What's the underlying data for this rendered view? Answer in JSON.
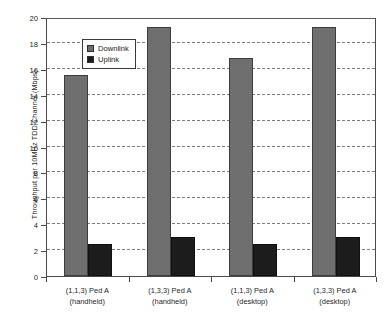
{
  "chart_data": {
    "type": "bar",
    "title": "",
    "xlabel": "",
    "ylabel": "Throughput per 10MHz TDD Channel (Mbps)",
    "ylim": [
      0,
      20
    ],
    "yticks": [
      0,
      2,
      4,
      6,
      8,
      10,
      12,
      14,
      16,
      18,
      20
    ],
    "grid": true,
    "legend_position": "upper-left-inside",
    "categories": [
      "(1,1,3) Ped A (handheld)",
      "(1,3,3) Ped A (handheld)",
      "(1,1,3) Ped A (desktop)",
      "(1,3,3) Ped A (desktop)"
    ],
    "category_lines": [
      {
        "line1": "(1,1,3) Ped A",
        "line2": "(handheld)"
      },
      {
        "line1": "(1,3,3) Ped A",
        "line2": "(handheld)"
      },
      {
        "line1": "(1,1,3) Ped A",
        "line2": "(desktop)"
      },
      {
        "line1": "(1,3,3) Ped A",
        "line2": "(desktop)"
      }
    ],
    "series": [
      {
        "name": "Downlink",
        "color": "#6e6e6e",
        "values": [
          15.5,
          19.2,
          16.8,
          19.2
        ]
      },
      {
        "name": "Uplink",
        "color": "#1c1c1c",
        "values": [
          2.5,
          3.05,
          2.5,
          3.05
        ]
      }
    ]
  },
  "legend": {
    "items": [
      {
        "label": "Downlink",
        "swatch": "downlink-swatch"
      },
      {
        "label": "Uplink",
        "swatch": "uplink-swatch"
      }
    ]
  },
  "bleed": {
    "text": ""
  }
}
